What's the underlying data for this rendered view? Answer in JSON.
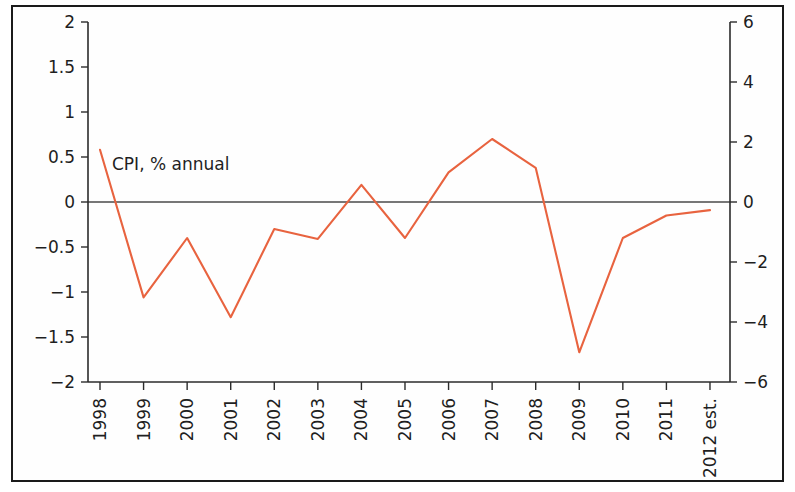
{
  "chart_data": {
    "type": "line",
    "title": "",
    "subtitle": "",
    "xlabel": "",
    "ylabel": "",
    "categories": [
      "1998",
      "1999",
      "2000",
      "2001",
      "2002",
      "2003",
      "2004",
      "2005",
      "2006",
      "2007",
      "2008",
      "2009",
      "2010",
      "2011",
      "2012 est."
    ],
    "series": [
      {
        "name": "CPI, % annual",
        "color": "#e8633f",
        "axis": "left",
        "values": [
          0.58,
          -1.06,
          -0.4,
          -1.28,
          -0.3,
          -0.41,
          0.19,
          -0.4,
          0.33,
          0.7,
          0.38,
          -1.67,
          -0.4,
          -0.15,
          -0.09
        ]
      }
    ],
    "annotations": [
      {
        "text": "CPI, % annual",
        "x_category": "1998",
        "y_value": 0.42
      }
    ],
    "left_axis": {
      "ylim": [
        -2,
        2
      ],
      "ticks": [
        2,
        1.5,
        1,
        0.5,
        0,
        -0.5,
        -1,
        -1.5,
        -2
      ],
      "tick_labels": [
        "2",
        "1.5",
        "1",
        "0.5",
        "0",
        "−0.5",
        "−1",
        "−1.5",
        "−2"
      ]
    },
    "right_axis": {
      "ylim": [
        -6,
        6
      ],
      "ticks": [
        6,
        4,
        2,
        0,
        -2,
        -4,
        -6
      ],
      "tick_labels": [
        "6",
        "4",
        "2",
        "0",
        "−2",
        "−4",
        "−6"
      ]
    },
    "grid": false,
    "legend": "none",
    "zero_line": true,
    "colors": {
      "series_line": "#e8633f",
      "axis": "#2b2b2b",
      "zero_line": "#4a4a4a",
      "frame_border": "#1a1a1a",
      "background": "#ffffff",
      "text": "#1f1f1f"
    }
  },
  "layout": {
    "plot_left": 88,
    "plot_right": 730,
    "plot_top": 22,
    "plot_bottom": 382,
    "x_first_tick": 100,
    "x_tick_spacing": 43.57
  }
}
